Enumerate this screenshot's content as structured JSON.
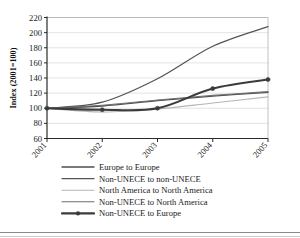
{
  "chart_data": {
    "type": "line",
    "title": "",
    "xlabel": "",
    "ylabel": "Index (2001=100)",
    "x": [
      "2001",
      "2002",
      "2003",
      "2004",
      "2005"
    ],
    "categories": [
      "2001",
      "2002",
      "2003",
      "2004",
      "2005"
    ],
    "ylim": [
      60,
      220
    ],
    "yticks": [
      60,
      80,
      100,
      120,
      140,
      160,
      180,
      200,
      220
    ],
    "grid": true,
    "grid_axis": "y",
    "legend_position": "bottom",
    "series": [
      {
        "name": "Europe to Europe",
        "values": [
          100,
          103,
          110,
          116,
          121
        ],
        "color": "#4f4f4f",
        "width": 1.3,
        "markers": false
      },
      {
        "name": "Non-UNECE to non-UNECE",
        "values": [
          100,
          108,
          139,
          182,
          208
        ],
        "color": "#565656",
        "width": 1.3,
        "markers": false
      },
      {
        "name": "North America to North America",
        "values": [
          100,
          95,
          99,
          107,
          115
        ],
        "color": "#b5b5b5",
        "width": 1.1,
        "markers": false
      },
      {
        "name": "Non-UNECE to North America",
        "values": [
          100,
          104,
          111,
          117,
          122
        ],
        "color": "#6e6e6e",
        "width": 1.1,
        "markers": false
      },
      {
        "name": "Non-UNECE to Europe",
        "values": [
          100,
          98,
          100,
          126,
          138
        ],
        "color": "#3b3b3b",
        "width": 2.1,
        "markers": true
      }
    ]
  },
  "axis": {
    "y_label": "Index (2001=100)",
    "y_ticks": [
      "220",
      "200",
      "180",
      "160",
      "140",
      "120",
      "100",
      "80",
      "60"
    ],
    "x_ticks": [
      "2001",
      "2002",
      "2003",
      "2004",
      "2005"
    ]
  },
  "legend": {
    "items": [
      {
        "label": "Europe to Europe"
      },
      {
        "label": "Non-UNECE to non-UNECE"
      },
      {
        "label": "North America to North America"
      },
      {
        "label": "Non-UNECE to North America"
      },
      {
        "label": "Non-UNECE to Europe"
      }
    ]
  }
}
